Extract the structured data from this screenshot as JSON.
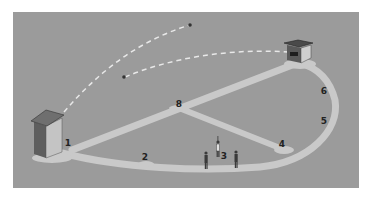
{
  "diagram": {
    "type": "isometric field layout",
    "colors": {
      "background": "#ffffff",
      "field": "#9b9b9b",
      "path": "#c9c9c9",
      "dash": "#e8e8e8",
      "booth_dark": "#5e5e5e",
      "booth_light": "#c4c4c4",
      "booth_roof": "#6f6f6f",
      "label": "#222222"
    },
    "markers": [
      {
        "id": "m1",
        "label": "1",
        "x": 68,
        "y": 143
      },
      {
        "id": "m2",
        "label": "2",
        "x": 145,
        "y": 157
      },
      {
        "id": "m3",
        "label": "3",
        "x": 224,
        "y": 156
      },
      {
        "id": "m4",
        "label": "4",
        "x": 282,
        "y": 144
      },
      {
        "id": "m5",
        "label": "5",
        "x": 324,
        "y": 121
      },
      {
        "id": "m6",
        "label": "6",
        "x": 324,
        "y": 91
      },
      {
        "id": "m8",
        "label": "8",
        "x": 179,
        "y": 104
      }
    ],
    "structures": [
      {
        "name": "left-booth"
      },
      {
        "name": "right-booth"
      }
    ],
    "figures_count": 3,
    "trajectories": 2
  }
}
